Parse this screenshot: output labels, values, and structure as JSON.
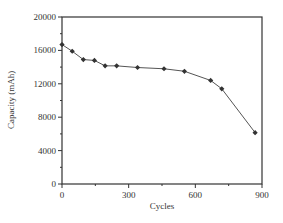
{
  "chart_data": {
    "type": "line",
    "title": "",
    "xlabel": "Cycles",
    "ylabel": "Capacity (mAh)",
    "xlim": [
      0,
      900
    ],
    "ylim": [
      0,
      20000
    ],
    "xticks": [
      0,
      300,
      600,
      900
    ],
    "xtick_labels": [
      "0",
      "300",
      "600",
      "900"
    ],
    "yticks": [
      0,
      4000,
      8000,
      12000,
      16000,
      20000
    ],
    "ytick_labels": [
      "0",
      "4000",
      "8000",
      "12000",
      "16000",
      "20000"
    ],
    "x_minor_step": 150,
    "y_minor_step": 2000,
    "grid": false,
    "legend": null,
    "marker": "diamond",
    "series": [
      {
        "name": "Capacity",
        "x": [
          0,
          46,
          96,
          146,
          194,
          246,
          340,
          459,
          551,
          669,
          719,
          869
        ],
        "values": [
          16700,
          15900,
          14900,
          14800,
          14150,
          14150,
          13950,
          13800,
          13500,
          12400,
          11400,
          6150
        ]
      }
    ],
    "colors": {
      "line": "#555555",
      "marker": "#333333",
      "axis": "#333333"
    }
  }
}
